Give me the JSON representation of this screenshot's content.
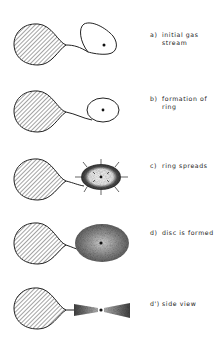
{
  "diagram": {
    "type": "accretion-disc-formation",
    "colors": {
      "ink": "#222222",
      "background": "#ffffff"
    },
    "stages": [
      {
        "id": "a",
        "tag": "a)",
        "label_line1": "initial gas",
        "label_line2": "stream"
      },
      {
        "id": "b",
        "tag": "b)",
        "label_line1": "formation of",
        "label_line2": "ring"
      },
      {
        "id": "c",
        "tag": "c)",
        "label_line1": "ring spreads",
        "label_line2": ""
      },
      {
        "id": "d",
        "tag": "d)",
        "label_line1": "disc is formed",
        "label_line2": ""
      },
      {
        "id": "d-prime",
        "tag": "d')",
        "label_line1": "side view",
        "label_line2": ""
      }
    ]
  }
}
